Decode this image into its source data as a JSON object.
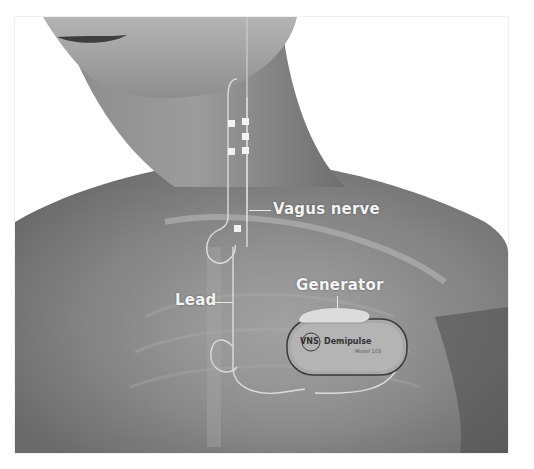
{
  "figure": {
    "labels": {
      "vagus_nerve": "Vagus nerve",
      "generator": "Generator",
      "lead": "Lead"
    },
    "device": {
      "brand_left": "VNS",
      "brand_right": "Demipulse",
      "model_text": "Model 103"
    },
    "colors": {
      "background": "#ffffff",
      "skin_dark": "#5e5e5e",
      "skin_mid": "#8a8a8a",
      "skin_light": "#b5b5b5",
      "label_text": "#f4f4f4"
    }
  }
}
